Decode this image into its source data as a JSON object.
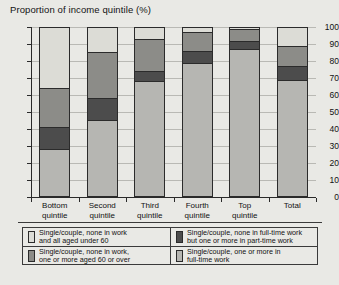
{
  "chart_data": {
    "type": "bar",
    "stacked": true,
    "title": "Proportion of income quintile (%)",
    "xlabel": "",
    "ylabel": "",
    "ylim": [
      0,
      100
    ],
    "ytick_step": 10,
    "yticks": [
      0,
      10,
      20,
      30,
      40,
      50,
      60,
      70,
      80,
      90,
      100
    ],
    "grid": true,
    "legend_position": "bottom",
    "categories": [
      "Bottom quintile",
      "Second quintile",
      "Third quintile",
      "Fourth quintile",
      "Top quintile",
      "Total"
    ],
    "category_lines": [
      [
        "Bottom",
        "quintile"
      ],
      [
        "Second",
        "quintile"
      ],
      [
        "Third",
        "quintile"
      ],
      [
        "Fourth",
        "quintile"
      ],
      [
        "Top",
        "quintile"
      ],
      [
        "Total"
      ]
    ],
    "series": [
      {
        "name": "Single/couple, one or more in full-time work",
        "color": "#b6b6b2",
        "values": [
          28,
          45.5,
          68,
          79,
          87,
          69
        ]
      },
      {
        "name": "Single/couple, none in full-time work but one or more in part-time work",
        "color": "#4c4c4c",
        "values": [
          13,
          13,
          6,
          7,
          5,
          8
        ]
      },
      {
        "name": "Single/couple, none in work, one or more aged 60 or over",
        "color": "#8c8c88",
        "values": [
          23,
          27,
          19,
          11,
          7,
          12
        ]
      },
      {
        "name": "Single/couple, none in work and all aged under 60",
        "color": "#dcdcd6",
        "values": [
          36,
          14.5,
          7,
          3,
          1,
          11
        ]
      }
    ],
    "legend_entries": [
      {
        "key": "none-in-work-under-60",
        "lines": [
          "Single/couple, none in work",
          "and all aged under 60"
        ],
        "color": "#dcdcd6"
      },
      {
        "key": "none-in-full-time-part-time",
        "lines": [
          "Single/couple, none in full-time work",
          "but one or more in part-time work"
        ],
        "color": "#4c4c4c"
      },
      {
        "key": "none-in-work-60-or-over",
        "lines": [
          "Single/couple, none in work,",
          "one or more aged 60 or over"
        ],
        "color": "#8c8c88"
      },
      {
        "key": "one-or-more-full-time",
        "lines": [
          "Single/couple, one or more in",
          "full-time work"
        ],
        "color": "#b6b6b2"
      }
    ]
  },
  "bottom_cut_text": ""
}
